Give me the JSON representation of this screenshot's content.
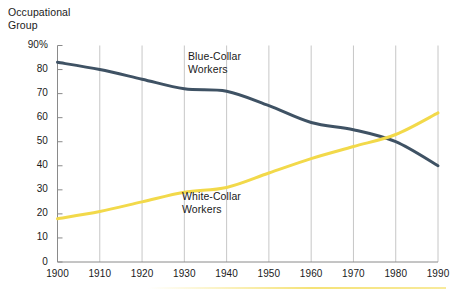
{
  "chart_data": {
    "type": "line",
    "title": "",
    "axis_title": "Occupational\nGroup",
    "xlabel": "",
    "ylabel": "",
    "x": [
      1900,
      1910,
      1920,
      1930,
      1940,
      1950,
      1960,
      1970,
      1980,
      1990
    ],
    "categories": [
      "1900",
      "1910",
      "1920",
      "1930",
      "1940",
      "1950",
      "1960",
      "1970",
      "1980",
      "1990"
    ],
    "xlim": [
      1900,
      1990
    ],
    "ylim": [
      0,
      90
    ],
    "yticks": [
      0,
      10,
      20,
      30,
      40,
      50,
      60,
      70,
      80,
      90
    ],
    "ytick_labels": [
      "0",
      "10",
      "20",
      "30",
      "40",
      "50",
      "60",
      "70",
      "80",
      "90%"
    ],
    "xtick_labels": [
      "1900",
      "1910",
      "1920",
      "1930",
      "1940",
      "1950",
      "1960",
      "1970",
      "1980",
      "1990"
    ],
    "grid": "vertical-only",
    "legend_position": "inline-annotations",
    "series": [
      {
        "name": "Blue-Collar Workers",
        "label": "Blue-Collar\nWorkers",
        "color": "#3f5264",
        "values": [
          83,
          80,
          76,
          72,
          71,
          65,
          58,
          55,
          50,
          40
        ]
      },
      {
        "name": "White-Collar Workers",
        "label": "White-Collar\nWorkers",
        "color": "#f2d94a",
        "values": [
          18,
          21,
          25,
          29,
          31,
          37,
          43,
          48,
          53,
          62
        ]
      }
    ],
    "annotations": [
      {
        "name": "blue-collar-annotation",
        "text": "Blue-Collar\nWorkers"
      },
      {
        "name": "white-collar-annotation",
        "text": "White-Collar\nWorkers"
      }
    ],
    "colors": {
      "blue_collar": "#3f5264",
      "white_collar": "#f2d94a",
      "gridline": "#b8b8b8",
      "axis": "#8a8a8a",
      "text": "#1a1a1a",
      "background": "#ffffff"
    }
  }
}
